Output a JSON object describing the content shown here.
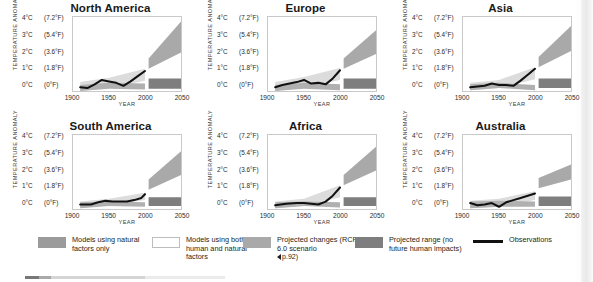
{
  "figure": {
    "axis_titles": {
      "y": "TEMPERATURE ANOMALY",
      "x": "YEAR"
    },
    "y_ticks": [
      {
        "c": "4°C",
        "f": "(7.2°F)"
      },
      {
        "c": "3°C",
        "f": "(5.4°F)"
      },
      {
        "c": "2°C",
        "f": "(3.6°F)"
      },
      {
        "c": "1°C",
        "f": "(1.8°F)"
      },
      {
        "c": "0°C",
        "f": "(0°F)"
      }
    ],
    "x_ticks": [
      "1900",
      "1950",
      "2000",
      "2050"
    ]
  },
  "panels": [
    {
      "title": "North America"
    },
    {
      "title": "Europe"
    },
    {
      "title": "Asia"
    },
    {
      "title": "South America"
    },
    {
      "title": "Africa"
    },
    {
      "title": "Australia"
    }
  ],
  "legend": {
    "items": [
      {
        "key": "natural",
        "label": "Models using natural factors only",
        "color": "#9b9b9b"
      },
      {
        "key": "both",
        "label": "Models using both human and natural factors",
        "color": "#ffffff"
      },
      {
        "key": "projected",
        "label": "Projected changes (RCP 6.0 scenario",
        "reference": "p.92)",
        "color": "#a9a9a9"
      },
      {
        "key": "range",
        "label": "Projected range (no future human impacts)",
        "color": "#7e7e7e"
      },
      {
        "key": "observations",
        "label": "Observations",
        "color": "#111111"
      }
    ]
  },
  "chart_data": {
    "type": "line",
    "xlabel": "YEAR",
    "ylabel": "TEMPERATURE ANOMALY",
    "xlim": [
      1900,
      2050
    ],
    "ylim": [
      -0.5,
      4.5
    ],
    "grid": false,
    "legend_position": "bottom",
    "y_tick_values": [
      0,
      1,
      2,
      3,
      4
    ],
    "y_tick_labels": [
      "0°C (0°F)",
      "1°C (1.8°F)",
      "2°C (3.6°F)",
      "3°C (5.4°F)",
      "4°C (7.2°F)"
    ],
    "x_tick_values": [
      1900,
      1950,
      2000,
      2050
    ],
    "x_tick_labels": [
      "1900",
      "1950",
      "2000",
      "2050"
    ],
    "panels": [
      {
        "name": "North America",
        "series": [
          {
            "name": "Observations",
            "x": [
              1910,
              1920,
              1930,
              1940,
              1950,
              1960,
              1970,
              1980,
              1990,
              2000
            ],
            "values": [
              -0.25,
              -0.3,
              -0.05,
              0.25,
              0.15,
              0.05,
              -0.15,
              0.15,
              0.5,
              0.85
            ]
          }
        ],
        "bands": [
          {
            "name": "Models using both human and natural factors",
            "x": [
              1910,
              1950,
              2000
            ],
            "lower": [
              -0.5,
              -0.3,
              0.2
            ],
            "upper": [
              0.1,
              0.4,
              1.0
            ]
          },
          {
            "name": "Models using natural factors only",
            "x": [
              1910,
              1950,
              2000
            ],
            "lower": [
              -0.5,
              -0.35,
              -0.4
            ],
            "upper": [
              -0.1,
              0.05,
              0.0
            ]
          },
          {
            "name": "Projected changes (RCP 6.0 scenario)",
            "x": [
              2005,
              2050
            ],
            "lower": [
              1.0,
              2.1
            ],
            "upper": [
              1.7,
              4.2
            ]
          },
          {
            "name": "Projected range (no future human impacts)",
            "x": [
              2005,
              2050
            ],
            "lower": [
              -0.35,
              -0.35
            ],
            "upper": [
              0.35,
              0.35
            ]
          }
        ]
      },
      {
        "name": "Europe",
        "series": [
          {
            "name": "Observations",
            "x": [
              1910,
              1920,
              1930,
              1940,
              1950,
              1960,
              1970,
              1980,
              1990,
              2000
            ],
            "values": [
              -0.25,
              -0.1,
              0.0,
              0.1,
              0.25,
              0.0,
              0.05,
              -0.05,
              0.35,
              0.9
            ]
          }
        ],
        "bands": [
          {
            "name": "Models using both human and natural factors",
            "x": [
              1910,
              1950,
              2000
            ],
            "lower": [
              -0.5,
              -0.25,
              0.25
            ],
            "upper": [
              0.1,
              0.45,
              1.05
            ]
          },
          {
            "name": "Models using natural factors only",
            "x": [
              1910,
              1950,
              2000
            ],
            "lower": [
              -0.5,
              -0.35,
              -0.45
            ],
            "upper": [
              -0.1,
              0.05,
              -0.05
            ]
          },
          {
            "name": "Projected changes (RCP 6.0 scenario)",
            "x": [
              2005,
              2050
            ],
            "lower": [
              1.0,
              2.0
            ],
            "upper": [
              1.7,
              3.6
            ]
          },
          {
            "name": "Projected range (no future human impacts)",
            "x": [
              2005,
              2050
            ],
            "lower": [
              -0.35,
              -0.35
            ],
            "upper": [
              0.35,
              0.35
            ]
          }
        ]
      },
      {
        "name": "Asia",
        "series": [
          {
            "name": "Observations",
            "x": [
              1910,
              1920,
              1930,
              1940,
              1950,
              1960,
              1970,
              1980,
              1990,
              2000
            ],
            "values": [
              -0.25,
              -0.2,
              -0.15,
              0.0,
              -0.1,
              -0.1,
              -0.15,
              0.2,
              0.6,
              1.0
            ]
          }
        ],
        "bands": [
          {
            "name": "Models using both human and natural factors",
            "x": [
              1910,
              1950,
              2000
            ],
            "lower": [
              -0.45,
              -0.3,
              0.3
            ],
            "upper": [
              0.05,
              0.25,
              1.1
            ]
          },
          {
            "name": "Models using natural factors only",
            "x": [
              1910,
              1950,
              2000
            ],
            "lower": [
              -0.45,
              -0.3,
              -0.45
            ],
            "upper": [
              -0.05,
              0.05,
              -0.1
            ]
          },
          {
            "name": "Projected changes (RCP 6.0 scenario)",
            "x": [
              2005,
              2050
            ],
            "lower": [
              1.1,
              2.2
            ],
            "upper": [
              1.8,
              3.9
            ]
          },
          {
            "name": "Projected range (no future human impacts)",
            "x": [
              2005,
              2050
            ],
            "lower": [
              -0.3,
              -0.3
            ],
            "upper": [
              0.35,
              0.35
            ]
          }
        ]
      },
      {
        "name": "South America",
        "series": [
          {
            "name": "Observations",
            "x": [
              1910,
              1925,
              1935,
              1945,
              1955,
              1965,
              1975,
              1985,
              1995,
              2000
            ],
            "values": [
              -0.2,
              -0.2,
              -0.05,
              0.05,
              0.0,
              0.0,
              0.0,
              0.1,
              0.25,
              0.5
            ]
          }
        ],
        "bands": [
          {
            "name": "Models using both human and natural factors",
            "x": [
              1910,
              1950,
              2000
            ],
            "lower": [
              -0.45,
              -0.25,
              0.1
            ],
            "upper": [
              0.0,
              0.2,
              0.6
            ]
          },
          {
            "name": "Models using natural factors only",
            "x": [
              1910,
              1950,
              2000
            ],
            "lower": [
              -0.45,
              -0.3,
              -0.35
            ],
            "upper": [
              -0.05,
              0.0,
              -0.05
            ]
          },
          {
            "name": "Projected changes (RCP 6.0 scenario)",
            "x": [
              2005,
              2050
            ],
            "lower": [
              0.8,
              1.8
            ],
            "upper": [
              1.5,
              3.4
            ]
          },
          {
            "name": "Projected range (no future human impacts)",
            "x": [
              2005,
              2050
            ],
            "lower": [
              -0.3,
              -0.3
            ],
            "upper": [
              0.3,
              0.3
            ]
          }
        ]
      },
      {
        "name": "Africa",
        "series": [
          {
            "name": "Observations",
            "x": [
              1910,
              1925,
              1940,
              1950,
              1960,
              1970,
              1980,
              1990,
              2000
            ],
            "values": [
              -0.25,
              -0.15,
              -0.1,
              -0.1,
              -0.15,
              -0.2,
              0.0,
              0.4,
              0.95
            ]
          }
        ],
        "bands": [
          {
            "name": "Models using both human and natural factors",
            "x": [
              1910,
              1950,
              2000
            ],
            "lower": [
              -0.45,
              -0.3,
              0.3
            ],
            "upper": [
              0.0,
              0.2,
              1.1
            ]
          },
          {
            "name": "Models using natural factors only",
            "x": [
              1910,
              1950,
              2000
            ],
            "lower": [
              -0.45,
              -0.3,
              -0.4
            ],
            "upper": [
              -0.05,
              0.0,
              -0.05
            ]
          },
          {
            "name": "Projected changes (RCP 6.0 scenario)",
            "x": [
              2005,
              2050
            ],
            "lower": [
              1.1,
              2.1
            ],
            "upper": [
              1.8,
              3.7
            ]
          },
          {
            "name": "Projected range (no future human impacts)",
            "x": [
              2005,
              2050
            ],
            "lower": [
              -0.3,
              -0.3
            ],
            "upper": [
              0.3,
              0.3
            ]
          }
        ]
      },
      {
        "name": "Australia",
        "series": [
          {
            "name": "Observations",
            "x": [
              1910,
              1920,
              1930,
              1940,
              1950,
              1960,
              1970,
              1980,
              1990,
              2000
            ],
            "values": [
              -0.1,
              -0.25,
              -0.2,
              -0.1,
              -0.35,
              -0.05,
              0.1,
              0.25,
              0.4,
              0.55
            ]
          }
        ],
        "bands": [
          {
            "name": "Models using both human and natural factors",
            "x": [
              1910,
              1950,
              2000
            ],
            "lower": [
              -0.45,
              -0.35,
              0.1
            ],
            "upper": [
              0.05,
              0.2,
              0.7
            ]
          },
          {
            "name": "Models using natural factors only",
            "x": [
              1910,
              1950,
              2000
            ],
            "lower": [
              -0.45,
              -0.35,
              -0.35
            ],
            "upper": [
              0.0,
              0.05,
              0.0
            ]
          },
          {
            "name": "Projected changes (RCP 6.0 scenario)",
            "x": [
              2005,
              2050
            ],
            "lower": [
              0.9,
              1.5
            ],
            "upper": [
              1.6,
              2.5
            ]
          },
          {
            "name": "Projected range (no future human impacts)",
            "x": [
              2005,
              2050
            ],
            "lower": [
              -0.3,
              -0.3
            ],
            "upper": [
              0.35,
              0.35
            ]
          }
        ]
      }
    ]
  }
}
